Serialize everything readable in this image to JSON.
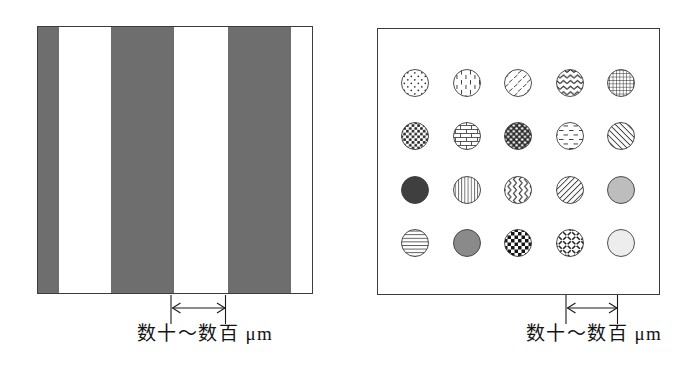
{
  "left_panel": {
    "stripe_color": "#6e6e6e",
    "background": "#ffffff",
    "box": {
      "left": 37,
      "top": 26,
      "width": 276,
      "height": 268
    },
    "stripes_px": [
      {
        "left": 0,
        "width": 21
      },
      {
        "left": 73,
        "width": 63
      },
      {
        "left": 190,
        "width": 63
      }
    ],
    "dimension_label": "数十～数百 μm"
  },
  "right_panel": {
    "rows": 4,
    "cols": 5,
    "box": {
      "left": 377,
      "top": 28,
      "width": 281,
      "height": 265
    },
    "radius": 13.5,
    "col_centers": [
      37,
      89,
      140,
      192,
      243
    ],
    "row_centers": [
      54,
      107,
      161,
      214
    ],
    "patterns": [
      [
        "dots",
        "vertical-dashes",
        "diagonal-dashes",
        "zigzag-horizontal",
        "grid"
      ],
      [
        "dense-dots",
        "brick",
        "inverse-dots",
        "horizontal-dashes",
        "diagonal-back"
      ],
      [
        "solid-dark",
        "vertical-lines",
        "zigzag-vertical",
        "diagonal-fwd",
        "solid-light"
      ],
      [
        "horizontal-lines",
        "solid-mid",
        "checker",
        "basket-weave",
        "solid-xlight"
      ]
    ],
    "dimension_label": "数十～数百 μm"
  },
  "colors": {
    "solid-dark": "#3f3f3f",
    "solid-mid": "#8a8a8a",
    "solid-light": "#bdbdbd",
    "solid-xlight": "#ededed",
    "outline": "#3c3c3c"
  }
}
